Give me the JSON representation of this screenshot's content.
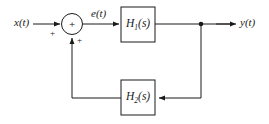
{
  "diagram": {
    "type": "feedback-block-diagram",
    "signals": {
      "input_label": "x(t)",
      "error_label": "e(t)",
      "output_label": "y(t)"
    },
    "blocks": [
      {
        "id": "H1",
        "base": "H",
        "subscript": "1",
        "argument": "(s)"
      },
      {
        "id": "H2",
        "base": "H",
        "subscript": "2",
        "argument": "(s)"
      }
    ],
    "summing_junction": {
      "center_sign": "+",
      "input_sign": "+",
      "feedback_sign": "+"
    },
    "colors": {
      "line": "#1a1a1a",
      "background": "#ffffff",
      "text": "#1a1a1a"
    }
  }
}
